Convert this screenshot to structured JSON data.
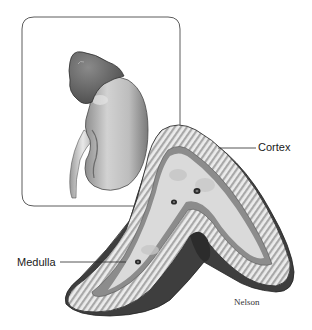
{
  "figure": {
    "top_caption": "",
    "inset": {
      "description": "Adrenal gland sitting atop the kidney",
      "border_color": "#4a4a4a"
    },
    "cross_section": {
      "description": "Cross section of adrenal gland"
    },
    "labels": {
      "cortex": "Cortex",
      "medulla": "Medulla"
    },
    "signature": "Nelson",
    "colors": {
      "line": "#2a2a2a",
      "cortex_fill": "#e6e6e6",
      "cortex_stripes": "#9a9a9a",
      "medulla_fill": "#d8d8d8",
      "capsule_dark": "#3a3a3a",
      "kidney_fill": "#c9c9c9",
      "adrenal_cap": "#6e6e6e"
    }
  }
}
